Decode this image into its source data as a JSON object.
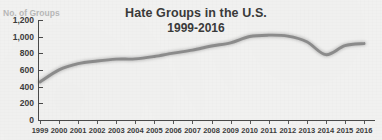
{
  "chart_data": {
    "type": "line",
    "title": "Hate Groups in the U.S.",
    "subtitle": "1999-2016",
    "xlabel": "",
    "ylabel": "No. of Groups",
    "ylim": [
      0,
      1200
    ],
    "yticks": [
      "0",
      "200",
      "400",
      "600",
      "800",
      "1,000",
      "1,200"
    ],
    "ytick_values": [
      0,
      200,
      400,
      600,
      800,
      1000,
      1200
    ],
    "grid": false,
    "legend": "none",
    "line_color": "#8d8d8d",
    "categories": [
      "1999",
      "2000",
      "2001",
      "2002",
      "2003",
      "2004",
      "2005",
      "2006",
      "2007",
      "2008",
      "2009",
      "2010",
      "2011",
      "2012",
      "2013",
      "2014",
      "2015",
      "2016"
    ],
    "x": [
      1999,
      2000,
      2001,
      2002,
      2003,
      2004,
      2005,
      2006,
      2007,
      2008,
      2009,
      2010,
      2011,
      2012,
      2013,
      2014,
      2015,
      2016
    ],
    "values": [
      457,
      602,
      676,
      708,
      730,
      733,
      762,
      803,
      838,
      888,
      926,
      1002,
      1018,
      1007,
      939,
      784,
      892,
      917
    ]
  },
  "figure": {
    "title": "Hate Groups in the U.S.",
    "subtitle": "1999-2016",
    "y_axis_caption": "No. of Groups"
  },
  "colors": {
    "background": "#f2f2f1",
    "line": "#8d8d8d",
    "axis": "#4a4a4a",
    "tick_text": "#3d3d3d",
    "title_text": "#3b3b3b",
    "y_caption_text": "#b9b9b9"
  }
}
